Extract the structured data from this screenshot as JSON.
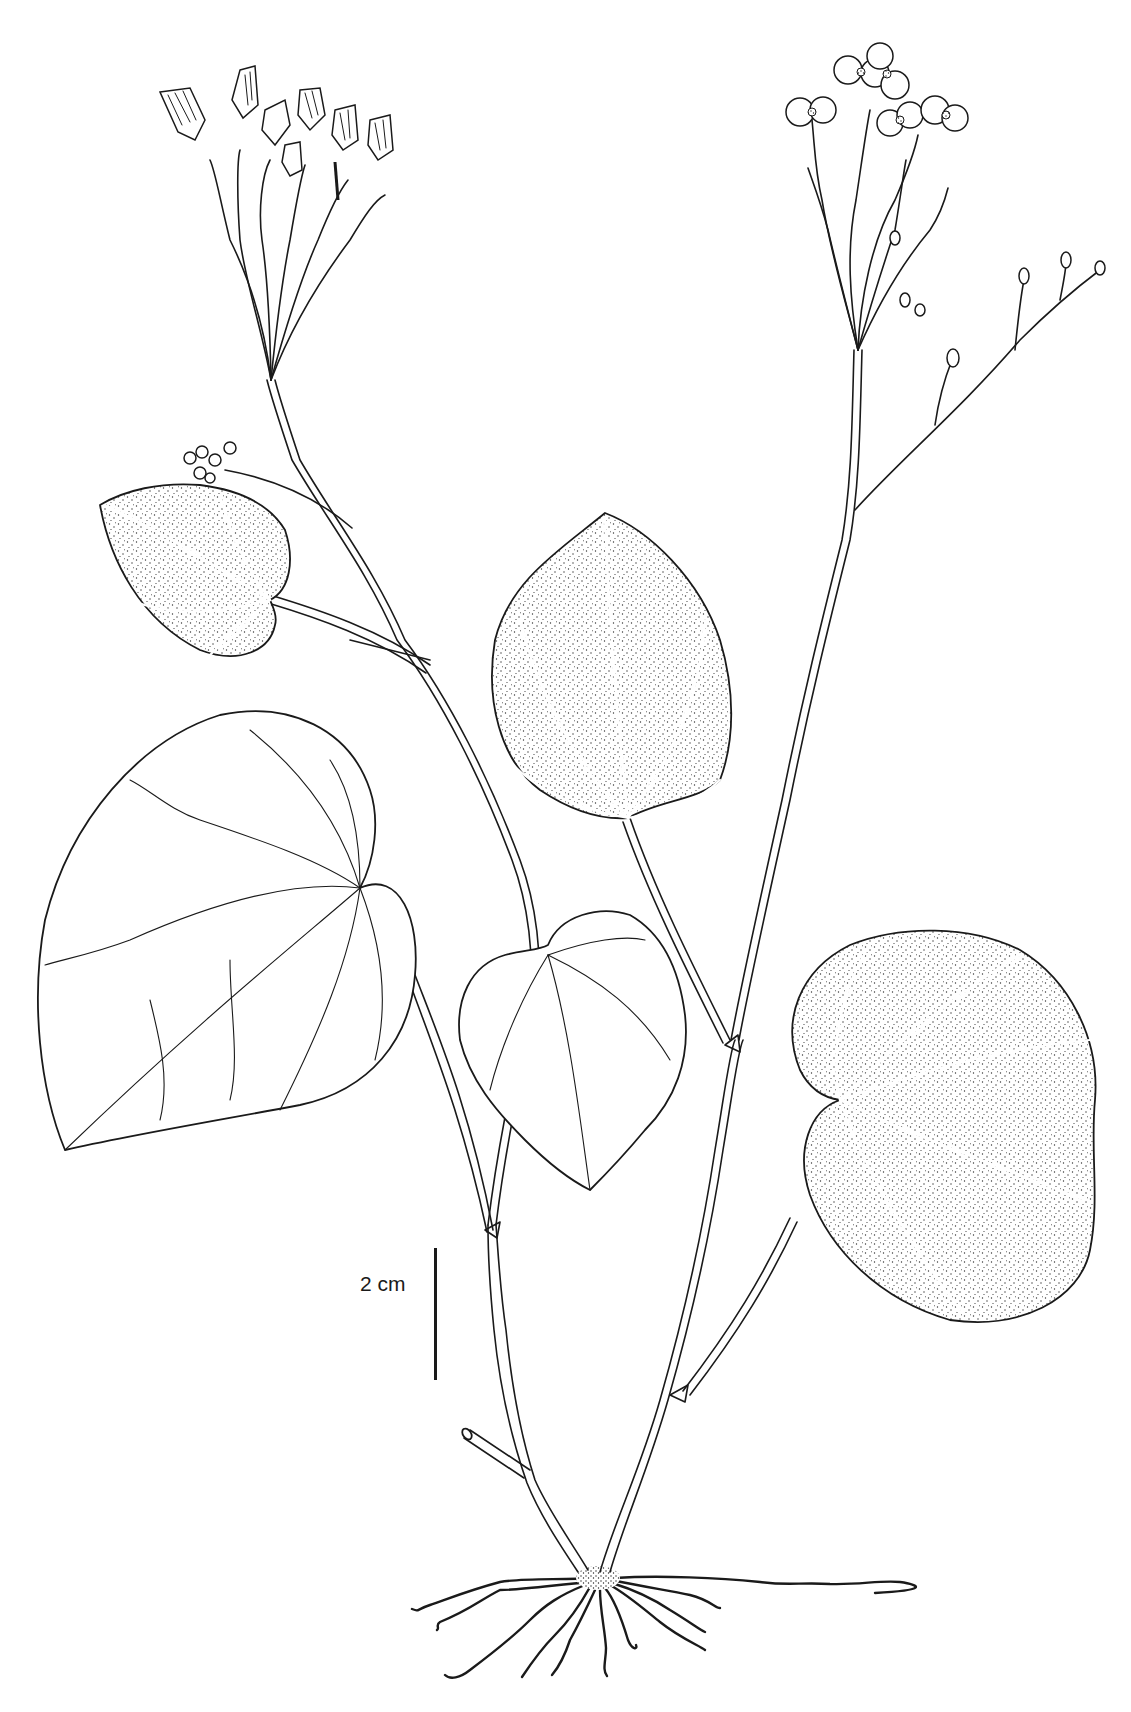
{
  "figure": {
    "scale_bar": {
      "label": "2 cm",
      "length_cm": 2
    },
    "colors": {
      "ink": "#1a1a1a",
      "background": "#ffffff"
    }
  }
}
